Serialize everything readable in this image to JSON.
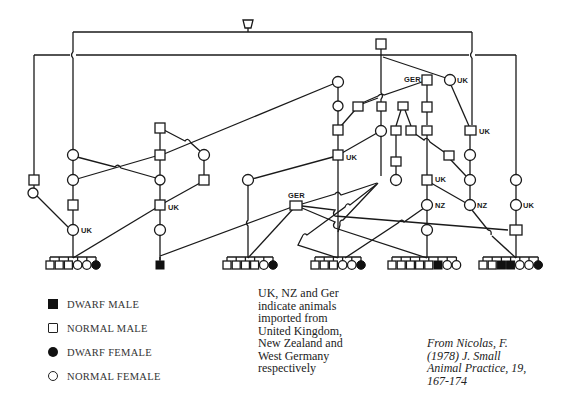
{
  "figure": {
    "type": "pedigree",
    "origin_labels": {
      "uk": "UK",
      "nz": "NZ",
      "ger": "GER"
    }
  },
  "legend": {
    "items": [
      {
        "symbol": "filled-square",
        "label": "DWARF MALE"
      },
      {
        "symbol": "open-square",
        "label": "NORMAL MALE"
      },
      {
        "symbol": "filled-circle",
        "label": "DWARF FEMALE"
      },
      {
        "symbol": "open-circle",
        "label": "NORMAL FEMALE"
      }
    ]
  },
  "note": {
    "lines": [
      "UK, NZ and Ger",
      "indicate animals",
      "imported from",
      "United Kingdom,",
      "New Zealand and",
      "West Germany",
      "respectively"
    ]
  },
  "citation": {
    "lines": [
      "From Nicolas, F.",
      "(1978) J. Small",
      "Animal Practice, 19,",
      "167-174"
    ]
  },
  "sibships": [
    {
      "id": "s1",
      "offspring": [
        "M",
        "M",
        "M",
        "F",
        "F",
        "DF"
      ]
    },
    {
      "id": "s2",
      "offspring": [
        "DM"
      ]
    },
    {
      "id": "s3",
      "offspring": [
        "M",
        "M",
        "M",
        "M",
        "F",
        "DF"
      ]
    },
    {
      "id": "s4",
      "offspring": [
        "M",
        "M",
        "M",
        "F",
        "F",
        "DF"
      ]
    },
    {
      "id": "s5",
      "offspring": [
        "M",
        "M",
        "M",
        "M",
        "M",
        "DM",
        "F",
        "F"
      ]
    },
    {
      "id": "s6",
      "offspring": [
        "M",
        "M",
        "DM",
        "DM",
        "F",
        "F",
        "DF"
      ]
    }
  ]
}
